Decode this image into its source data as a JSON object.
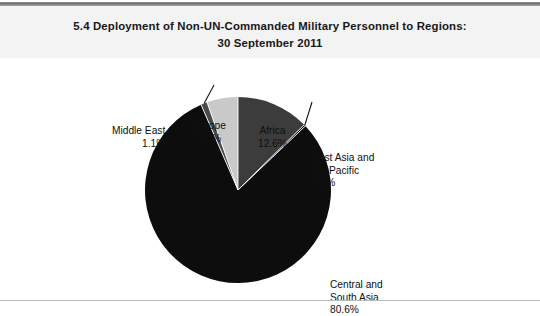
{
  "figure": {
    "number": "5.4",
    "title_line1": "5.4  Deployment of Non-UN-Commanded Military Personnel to Regions:",
    "title_line2": "30 September 2011",
    "background_color": "#ffffff",
    "title_band_color": "#f3f3f3",
    "rule_color": "#6e7073",
    "bottom_rule_color": "#b9bbbd"
  },
  "chart_data": {
    "type": "pie",
    "title": "5.4  Deployment of Non-UN-Commanded Military Personnel to Regions: 30 September 2011",
    "xlabel": "",
    "ylabel": "",
    "units": "percent",
    "start_angle_deg": 0,
    "direction": "clockwise",
    "legend": "none",
    "grid": false,
    "categories": [
      "Africa",
      "East Asia and the Pacific",
      "Central and South Asia",
      "Middle East",
      "Europe"
    ],
    "values": [
      12.6,
      0.3,
      80.6,
      1.1,
      5.4
    ],
    "slices": [
      {
        "name": "Africa",
        "label_line1": "Africa",
        "label_line2": "12.6%",
        "value": 12.6,
        "color": "#3c3c3c",
        "leader_line": false
      },
      {
        "name": "East Asia and the Pacific",
        "label_line1": "East Asia and",
        "label_line2": "the Pacific",
        "label_line3": "0.3%",
        "value": 0.3,
        "color": "#0d0d0d",
        "leader_line": true
      },
      {
        "name": "Central and South Asia",
        "label_line1": "Central and",
        "label_line2": "South Asia",
        "label_line3": "80.6%",
        "value": 80.6,
        "color": "#0d0d0d",
        "leader_line": false
      },
      {
        "name": "Middle East",
        "label_line1": "Middle East",
        "label_line2": "1.1%",
        "value": 1.1,
        "color": "#4a4a4a",
        "leader_line": true
      },
      {
        "name": "Europe",
        "label_line1": "Europe",
        "label_line2": "5.4%",
        "value": 5.4,
        "color": "#c9c9c9",
        "leader_line": false
      }
    ]
  }
}
